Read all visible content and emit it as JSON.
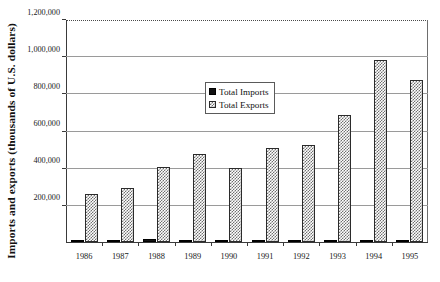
{
  "chart_data": {
    "type": "bar",
    "title": "",
    "xlabel": "",
    "ylabel": "Imports and exports (thousands of U.S. dollars)",
    "categories": [
      "1986",
      "1987",
      "1988",
      "1989",
      "1990",
      "1991",
      "1992",
      "1993",
      "1994",
      "1995"
    ],
    "series": [
      {
        "name": "Total Imports",
        "values": [
          1000,
          9000,
          14000,
          1000,
          1000,
          1000,
          1000,
          1000,
          7000,
          5000
        ]
      },
      {
        "name": "Total Exports",
        "values": [
          258000,
          288000,
          402000,
          475000,
          400000,
          505000,
          520000,
          685000,
          982000,
          870000
        ]
      }
    ],
    "ylim": [
      0,
      1200000
    ],
    "ytick_values": [
      0,
      200000,
      400000,
      600000,
      800000,
      1000000,
      1200000
    ],
    "ytick_labels": [
      "",
      "200,000",
      "400,000",
      "600,000",
      "800,000",
      "1,000,000",
      "1,200,000"
    ],
    "grid": true,
    "grid_axis": "y",
    "legend_position": "upper center",
    "legend_entries": [
      "Total Imports",
      "Total Exports"
    ],
    "colors": {
      "imports": "#141414",
      "exports": "#707070",
      "gridline": "#9a9a9a",
      "axis": "#3a3a3a",
      "background": "#ffffff"
    }
  }
}
